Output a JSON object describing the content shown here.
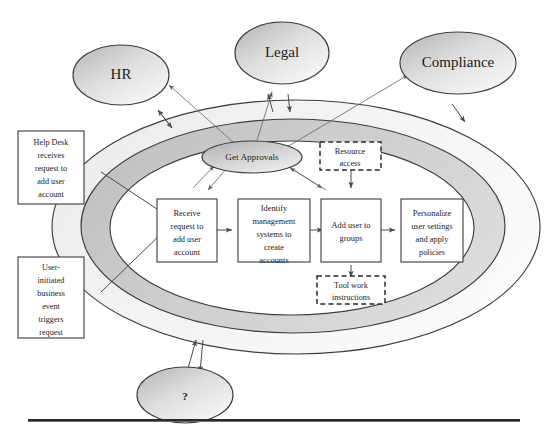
{
  "figure": {
    "type": "process-flow-diagram",
    "title_visible": false,
    "colors": {
      "outer_ring_fill": "#efefef",
      "inner_ring_fill": "#c9c9c9",
      "core_fill": "#ffffff",
      "ellipse_fill_light": "#f4f4f4",
      "ellipse_fill_dark": "#b5b5b5",
      "stroke": "#3d3d3d",
      "arrow": "#4a4a4a",
      "text": "#1b1b1b"
    }
  },
  "external_entities": [
    {
      "id": "hr",
      "label": "HR"
    },
    {
      "id": "legal",
      "label": "Legal"
    },
    {
      "id": "compliance",
      "label": "Compliance"
    },
    {
      "id": "unknown",
      "label": "?"
    }
  ],
  "trigger_boxes": [
    {
      "id": "help-desk-trigger",
      "lines": [
        "Help Desk",
        "receives",
        "request to",
        "add user",
        "account"
      ]
    },
    {
      "id": "user-initiated-trigger",
      "lines": [
        "User-",
        "initiated",
        "business",
        "event",
        "triggers",
        "request"
      ]
    }
  ],
  "process_steps": [
    {
      "id": "step-1",
      "lines": [
        "Receive",
        "request to",
        "add user",
        "account"
      ]
    },
    {
      "id": "step-2",
      "lines": [
        "Identify",
        "management",
        "systems to",
        "create",
        "accounts"
      ]
    },
    {
      "id": "step-3",
      "lines": [
        "Add user to",
        "groups"
      ]
    },
    {
      "id": "step-4",
      "lines": [
        "Personalize",
        "user settings",
        "and apply",
        "policies"
      ]
    }
  ],
  "decision_ellipse": {
    "id": "get-approvals",
    "label": "Get Approvals"
  },
  "dashed_artifacts": [
    {
      "id": "resource-access",
      "lines": [
        "Resource",
        "access"
      ]
    },
    {
      "id": "tool-work-instructions",
      "lines": [
        "Tool work",
        "instructions"
      ]
    }
  ],
  "footer_rule": {
    "visible": true
  }
}
